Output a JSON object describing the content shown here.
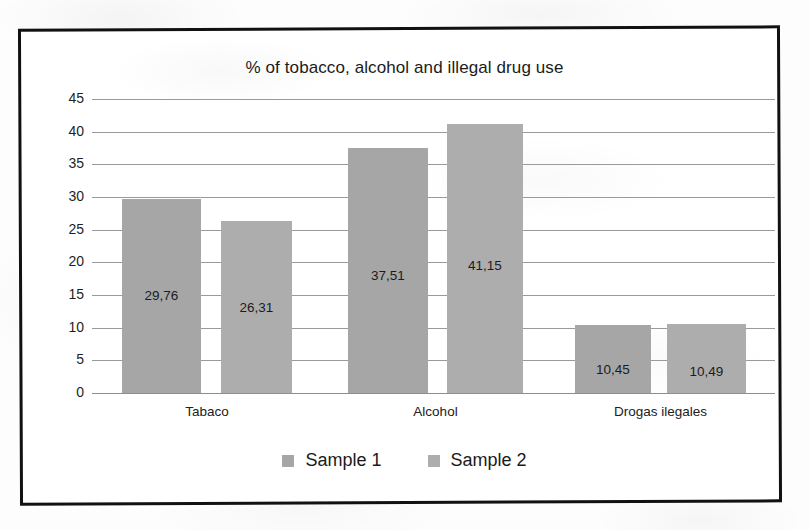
{
  "chart_data": {
    "type": "bar",
    "title": "% of tobacco, alcohol and illegal drug use",
    "xlabel": "",
    "ylabel": "",
    "categories": [
      "Tabaco",
      "Alcohol",
      "Drogas ilegales"
    ],
    "series": [
      {
        "name": "Sample 1",
        "color": "#a6a6a6",
        "values": [
          29.76,
          37.51,
          10.45
        ],
        "labels": [
          "29,76",
          "37,51",
          "10,45"
        ]
      },
      {
        "name": "Sample 2",
        "color": "#adadad",
        "values": [
          26.31,
          41.15,
          10.49
        ],
        "labels": [
          "26,31",
          "41,15",
          "10,49"
        ]
      }
    ],
    "ylim": [
      0,
      45
    ],
    "yticks": [
      "45",
      "40",
      "35",
      "30",
      "25",
      "20",
      "15",
      "10",
      "5",
      "0"
    ],
    "ytick_values": [
      45,
      40,
      35,
      30,
      25,
      20,
      15,
      10,
      5,
      0
    ],
    "grid": true,
    "legend_position": "bottom",
    "decimal_separator": ","
  }
}
